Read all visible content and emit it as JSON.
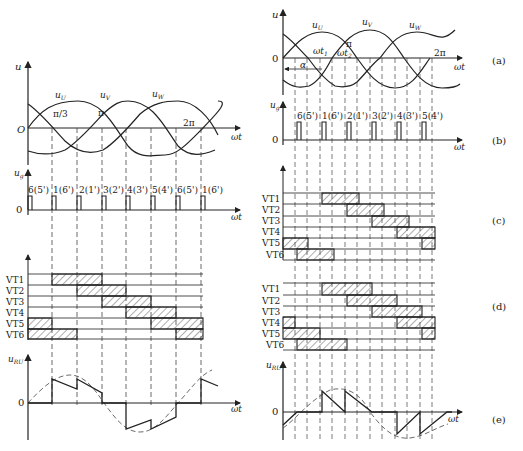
{
  "left": {
    "u_axis": "u",
    "origin": "O",
    "wt": "ωt",
    "phases": [
      "u",
      "u",
      "u"
    ],
    "phase_subs": [
      "U",
      "V",
      "W"
    ],
    "angles": [
      "π/3",
      "π",
      "2π"
    ],
    "ug_label": "u",
    "ug_sub": "g",
    "zero": "0",
    "pulses": [
      "6(5')",
      "1(6')",
      "2(1')",
      "3(2')",
      "4(3')",
      "5(4')",
      "6(5')",
      "1(6')"
    ],
    "vt_labels": [
      "VT1",
      "VT2",
      "VT3",
      "VT4",
      "VT5",
      "VT6"
    ],
    "uru_label": "u",
    "uru_sub": "RU"
  },
  "right": {
    "u_axis": "u",
    "zero": "0",
    "wt": "ωt",
    "phase_subs": [
      "U",
      "V",
      "W"
    ],
    "angles": [
      "π",
      "2π"
    ],
    "wt1": "ωt",
    "wt1_sub": "1",
    "wt2": "ωt",
    "wt2_sub": "2",
    "alpha": "α",
    "ug_sub": "g",
    "pulses": [
      "6(5')",
      "1(6')",
      "2(1')",
      "3(2')",
      "4(3')",
      "5(4')"
    ],
    "vt_labels_c": [
      "VT1",
      "VT2",
      "VT3",
      "VT4",
      "VT5",
      "VT6"
    ],
    "vt_labels_d": [
      "VT1",
      "VT2",
      "VT3",
      "VT4",
      "VT5",
      "VT6"
    ],
    "uru_sub": "RU",
    "panel_labels": [
      "(a)",
      "(b)",
      "(c)",
      "(d)",
      "(e)"
    ]
  }
}
